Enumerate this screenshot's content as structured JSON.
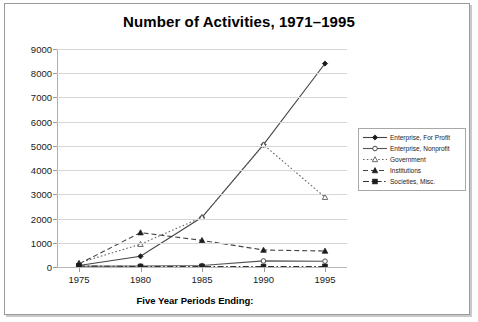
{
  "chart_data": {
    "type": "line",
    "title": "Number of Activities, 1971–1995",
    "xlabel": "Five Year Periods Ending:",
    "ylabel": "",
    "categories": [
      "1975",
      "1980",
      "1985",
      "1990",
      "1995"
    ],
    "x": [
      1975,
      1980,
      1985,
      1990,
      1995
    ],
    "ylim": [
      0,
      9000
    ],
    "ytick_labels": [
      "0",
      "1000",
      "2000",
      "3000",
      "4000",
      "5000",
      "6000",
      "7000",
      "8000",
      "9000"
    ],
    "ytick_values": [
      0,
      1000,
      2000,
      3000,
      4000,
      5000,
      6000,
      7000,
      8000,
      9000
    ],
    "grid": true,
    "legend_position": "right",
    "series": [
      {
        "name": "Enterprise, For Profit",
        "values": [
          60,
          440,
          2050,
          5050,
          8400
        ],
        "marker": "filled-diamond",
        "line_style": "solid",
        "color": "#444444"
      },
      {
        "name": "Enterprise, Nonprofit",
        "values": [
          30,
          40,
          60,
          250,
          240
        ],
        "marker": "open-circle",
        "line_style": "solid",
        "color": "#555555"
      },
      {
        "name": "Government",
        "values": [
          170,
          940,
          2050,
          5050,
          2880
        ],
        "marker": "open-triangle",
        "line_style": "dotted",
        "color": "#666666"
      },
      {
        "name": "Institutions",
        "values": [
          130,
          1420,
          1100,
          700,
          660
        ],
        "marker": "filled-triangle",
        "line_style": "dashed",
        "color": "#444444"
      },
      {
        "name": "Societies, Misc.",
        "values": [
          40,
          20,
          20,
          20,
          20
        ],
        "marker": "filled-square",
        "line_style": "dash-dot",
        "color": "#333333"
      }
    ]
  }
}
